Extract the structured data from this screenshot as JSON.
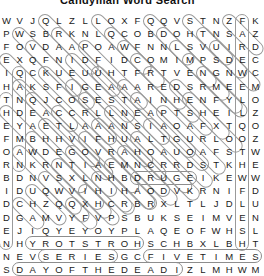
{
  "title": "Candyman Word Search",
  "grid": {
    "rows": 20,
    "cols": 19,
    "cell_size": 13.1,
    "letters": [
      "WVJQLZLLOXFQQVSTNZFK",
      "PWSBRKNLQCOBDOHTNSAZ",
      "FOVDAAPOAWFNNLSVUIRD",
      "EXQFNIDFIDCOMIMPSDEC",
      "IQCKUEUUHTFRTVENGNWC",
      "HAKSFIGEAAAREDSRMEEM",
      "TNQJCOSESTAINHENFYLO",
      "HDEACCRLLNEAPTSHEILZ",
      "EYAETLAAANSIAOAFXTQO",
      "FMBHHVIFHUALTGURLOOZ",
      "OAWDEGOVRAHOAUOAFSTW",
      "RNKRNTIAEMNCRRDSTKHE",
      "BDNVSXLNHBDRUGEIKEWW",
      "IDUQWVIHIHAODVKRNIFD",
      "DCHZQQXHCRBRXLTLJDLU",
      "DGAMVYFVPSBUKSEIMVEN",
      "EJIQYEYOYPLAQEOFWHSL",
      "NHYROTSTROHSCHBXLBHT",
      "NEVSERIESGCFIVETIMES",
      "SDAYOFTHEDEADIZLMHWM"
    ]
  },
  "found_words": [
    {
      "text": "THEFORBIDDEN",
      "dir": "vertical",
      "col": 0,
      "row": 6,
      "len": 12
    },
    {
      "text": "CANDYMAN",
      "dir": "vertical",
      "col": 1,
      "row": 4,
      "len": 8
    },
    {
      "text": "FAREWELLTOTHEFLESH",
      "dir": "vertical",
      "col": 18,
      "row": 0,
      "len": 18
    },
    {
      "text": "HORRORSTORY",
      "dir": "horizontal-rev",
      "col": 2,
      "row": 17,
      "len": 9
    },
    {
      "text": "SERIES",
      "dir": "horizontal",
      "col": 3,
      "row": 18,
      "len": 6
    },
    {
      "text": "FIVETIMES",
      "dir": "horizontal",
      "col": 11,
      "row": 18,
      "len": 9
    },
    {
      "text": "DAYOFTHEDEAD",
      "dir": "horizontal",
      "col": 1,
      "row": 19,
      "len": 13
    },
    {
      "text": "DRUGE",
      "dir": "horizontal",
      "col": 10,
      "row": 12,
      "len": 5
    }
  ],
  "colors": {
    "mark_stroke": "#8d8d8d",
    "letter": "#1a1a1a",
    "background": "#ffffff"
  }
}
